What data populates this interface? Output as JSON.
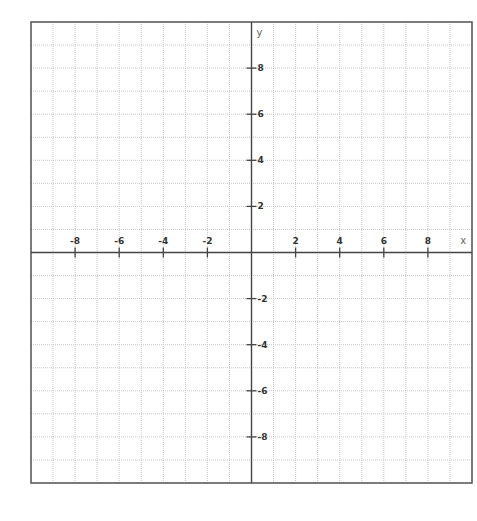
{
  "chart_data": {
    "type": "scatter",
    "title": "",
    "xlabel": "x",
    "ylabel": "y",
    "xlim": [
      -10,
      10
    ],
    "ylim": [
      -10,
      10
    ],
    "grid": true,
    "grid_step": 1,
    "x_ticks": [
      -8,
      -6,
      -4,
      -2,
      2,
      4,
      6,
      8
    ],
    "y_ticks": [
      8,
      6,
      4,
      2,
      -2,
      -4,
      -6,
      -8
    ],
    "x_tick_labels": [
      "-8",
      "-6",
      "-4",
      "-2",
      "2",
      "4",
      "6",
      "8"
    ],
    "y_tick_labels": [
      "8",
      "6",
      "4",
      "2",
      "-2",
      "-4",
      "-6",
      "-8"
    ],
    "series": []
  }
}
